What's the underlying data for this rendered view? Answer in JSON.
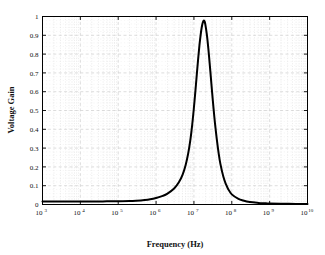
{
  "chart_data": {
    "type": "line",
    "title": "",
    "xlabel": "Frequency (Hz)",
    "ylabel": "Voltage Gain",
    "xscale": "log",
    "yscale": "linear",
    "xlim": [
      1000,
      10000000000
    ],
    "ylim": [
      0,
      1
    ],
    "grid": true,
    "grid_style": "dashed-gray-major-and-minor",
    "legend": "none",
    "xticks": [
      1000,
      10000,
      100000,
      1000000,
      10000000,
      100000000,
      1000000000,
      10000000000
    ],
    "xtick_labels": [
      "10^3",
      "10^4",
      "10^5",
      "10^6",
      "10^7",
      "10^8",
      "10^9",
      "10^10"
    ],
    "xtick_mantissas": [
      "10",
      "10",
      "10",
      "10",
      "10",
      "10",
      "10",
      "10"
    ],
    "xtick_exponents": [
      "3",
      "4",
      "5",
      "6",
      "7",
      "8",
      "9",
      "10"
    ],
    "yticks": [
      0,
      0.1,
      0.2,
      0.3,
      0.4,
      0.5,
      0.6,
      0.7,
      0.8,
      0.9,
      1
    ],
    "ytick_labels": [
      "0",
      "0.1",
      "0.2",
      "0.3",
      "0.4",
      "0.5",
      "0.6",
      "0.7",
      "0.8",
      "0.9",
      "1"
    ],
    "series": [
      {
        "name": "Voltage Gain",
        "color": "#000000",
        "linewidth": 2.0,
        "x": [
          1000,
          2000,
          3000,
          5000,
          8000,
          10000,
          20000,
          30000,
          50000,
          80000,
          100000,
          200000,
          300000,
          500000,
          700000,
          1000000,
          1500000,
          2000000,
          3000000,
          4000000,
          5000000,
          6000000,
          7000000,
          8000000,
          9000000,
          10000000,
          11000000,
          12000000,
          13000000,
          14000000,
          15000000,
          16000000,
          17000000,
          18000000,
          19000000,
          20000000,
          22000000,
          24000000,
          26000000,
          28000000,
          30000000,
          33000000,
          36000000,
          40000000,
          45000000,
          50000000,
          60000000,
          70000000,
          80000000,
          100000000,
          150000000,
          200000000,
          300000000,
          500000000,
          800000000,
          1000000000,
          2000000000,
          5000000000,
          10000000000
        ],
        "y": [
          0.016,
          0.016,
          0.016,
          0.016,
          0.016,
          0.016,
          0.016,
          0.016,
          0.017,
          0.017,
          0.017,
          0.018,
          0.02,
          0.024,
          0.028,
          0.035,
          0.046,
          0.058,
          0.085,
          0.118,
          0.158,
          0.208,
          0.268,
          0.34,
          0.424,
          0.516,
          0.61,
          0.7,
          0.78,
          0.848,
          0.9,
          0.94,
          0.965,
          0.978,
          0.975,
          0.958,
          0.902,
          0.83,
          0.752,
          0.676,
          0.604,
          0.51,
          0.432,
          0.35,
          0.272,
          0.216,
          0.147,
          0.108,
          0.083,
          0.054,
          0.03,
          0.021,
          0.013,
          0.0085,
          0.006,
          0.005,
          0.004,
          0.003,
          0.003
        ],
        "peak_value": 0.98,
        "peak_frequency": 18000000,
        "baseline_low": 0.016,
        "baseline_high": 0.003
      }
    ]
  },
  "figure": {
    "background_color": "#ffffff",
    "axes_color": "#000000",
    "grid_color": "#cfcfcf",
    "text_color": "#111111"
  }
}
